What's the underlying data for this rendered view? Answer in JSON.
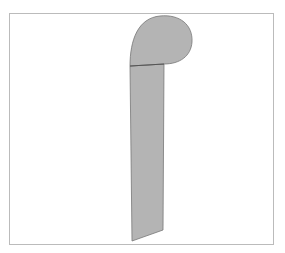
{
  "caption": "",
  "figure": {
    "fill_color": "#b4b4b4",
    "stroke_color": "#666666",
    "frame_color": "#bbbbbb"
  }
}
